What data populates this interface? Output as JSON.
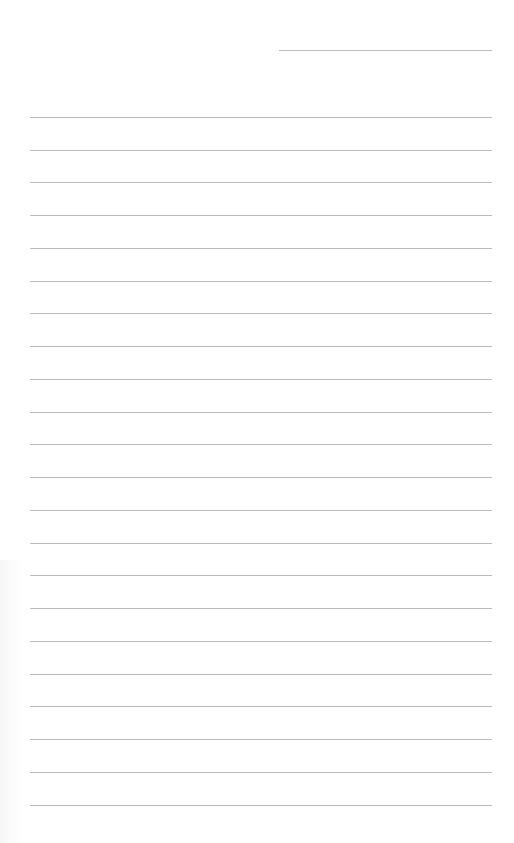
{
  "page": {
    "type": "lined-paper",
    "background_color": "#ffffff",
    "line_color": "#bcbcbc"
  },
  "date_line": {
    "x_start": 279,
    "x_end": 492,
    "y": 50,
    "text": ""
  },
  "ruled_lines": {
    "count": 22,
    "x_start": 30,
    "x_end": 492,
    "y_positions": [
      117,
      150,
      182,
      215,
      248,
      281,
      313,
      346,
      379,
      412,
      444,
      477,
      510,
      543,
      575,
      608,
      641,
      674,
      706,
      739,
      772,
      805
    ],
    "texts": [
      "",
      "",
      "",
      "",
      "",
      "",
      "",
      "",
      "",
      "",
      "",
      "",
      "",
      "",
      "",
      "",
      "",
      "",
      "",
      "",
      "",
      ""
    ]
  }
}
